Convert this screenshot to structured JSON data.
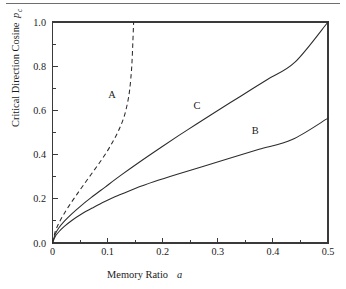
{
  "figure": {
    "kind": "line-chart",
    "background_color": "#ffffff",
    "ink_color": "#2b2b2b",
    "top_rule_color": "#6e6e6e"
  },
  "chart_data": {
    "type": "line",
    "title": "",
    "xlabel": "Memory Ratio",
    "xlabel_variable": "a",
    "ylabel": "Critical Direction Cosine",
    "ylabel_variable": "p",
    "ylabel_variable_subscript": "c",
    "xlim": [
      0,
      0.5
    ],
    "ylim": [
      0,
      1.0
    ],
    "grid": false,
    "legend": "inline-curve-labels",
    "x_major_ticks": [
      "0",
      "0.1",
      "0.2",
      "0.3",
      "0.4",
      "0.5"
    ],
    "x_major_values": [
      0,
      0.1,
      0.2,
      0.3,
      0.4,
      0.5
    ],
    "x_minor_values": [
      0.05,
      0.15,
      0.25,
      0.35,
      0.45
    ],
    "y_major_ticks": [
      "0.0",
      "0.2",
      "0.4",
      "0.6",
      "0.8",
      "1.0"
    ],
    "y_major_values": [
      0,
      0.2,
      0.4,
      0.6,
      0.8,
      1.0
    ],
    "y_minor_values": [
      0.1,
      0.3,
      0.5,
      0.7,
      0.9
    ],
    "series": [
      {
        "name": "A",
        "label": "A",
        "style": "dashed",
        "label_x": 0.108,
        "label_y": 0.655,
        "x": [
          0.0,
          0.005,
          0.012,
          0.02,
          0.03,
          0.042,
          0.055,
          0.07,
          0.085,
          0.1,
          0.112,
          0.122,
          0.13,
          0.136,
          0.14,
          0.143,
          0.1445,
          0.1455,
          0.1462,
          0.1468,
          0.1472
        ],
        "y": [
          0.0,
          0.052,
          0.092,
          0.128,
          0.168,
          0.212,
          0.258,
          0.31,
          0.362,
          0.418,
          0.47,
          0.52,
          0.572,
          0.632,
          0.692,
          0.77,
          0.83,
          0.888,
          0.932,
          0.97,
          1.0
        ]
      },
      {
        "name": "C",
        "label": "C",
        "style": "solid",
        "label_x": 0.262,
        "label_y": 0.608,
        "x": [
          0.0,
          0.005,
          0.012,
          0.022,
          0.035,
          0.05,
          0.07,
          0.095,
          0.125,
          0.16,
          0.2,
          0.245,
          0.29,
          0.34,
          0.39,
          0.44,
          0.5
        ],
        "y": [
          0.0,
          0.04,
          0.07,
          0.1,
          0.132,
          0.165,
          0.205,
          0.252,
          0.308,
          0.37,
          0.438,
          0.512,
          0.584,
          0.662,
          0.74,
          0.818,
          1.0
        ]
      },
      {
        "name": "B",
        "label": "B",
        "style": "solid",
        "label_x": 0.368,
        "label_y": 0.494,
        "x": [
          0.0,
          0.005,
          0.012,
          0.022,
          0.035,
          0.052,
          0.072,
          0.095,
          0.12,
          0.15,
          0.185,
          0.225,
          0.27,
          0.32,
          0.375,
          0.435,
          0.5
        ],
        "y": [
          0.0,
          0.03,
          0.052,
          0.076,
          0.102,
          0.13,
          0.158,
          0.188,
          0.216,
          0.247,
          0.278,
          0.31,
          0.344,
          0.382,
          0.424,
          0.468,
          0.565
        ]
      }
    ]
  }
}
